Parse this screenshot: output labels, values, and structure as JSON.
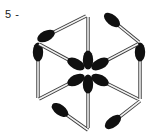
{
  "figure": {
    "kind": "matchstick-hexagon-diagram",
    "title": "",
    "axis": {
      "tick_label": "5 -",
      "tick_value": "5",
      "position": "left"
    },
    "colors": {
      "head": "#101010",
      "stick_fill": "#f2f2f2",
      "stick_outline": "#3a3a3a",
      "background": "#ffffff",
      "text": "#1a1a1a"
    },
    "counts": {
      "outer_matches": 6,
      "inner_matches": 6,
      "total_matches": 12
    },
    "geometry": {
      "center": [
        88,
        72
      ],
      "hexagon_vertices": [
        [
          88,
          15
        ],
        [
          140,
          43
        ],
        [
          140,
          100
        ],
        [
          88,
          130
        ],
        [
          37,
          100
        ],
        [
          37,
          43
        ]
      ]
    },
    "matches": [
      {
        "name": "outer-top-left",
        "head": [
          46,
          36
        ],
        "tail": [
          86,
          16
        ],
        "head_angle": -26
      },
      {
        "name": "outer-top-right",
        "head": [
          112,
          20
        ],
        "tail": [
          139,
          42
        ],
        "head_angle": 38
      },
      {
        "name": "outer-right",
        "head": [
          140,
          52
        ],
        "tail": [
          140,
          99
        ],
        "head_angle": 90
      },
      {
        "name": "outer-bottom-right",
        "head": [
          113,
          122
        ],
        "tail": [
          140,
          101
        ],
        "head_angle": -38
      },
      {
        "name": "outer-bottom-left",
        "head": [
          60,
          110
        ],
        "tail": [
          88,
          130
        ],
        "head_angle": 36
      },
      {
        "name": "outer-left",
        "head": [
          38,
          52
        ],
        "tail": [
          38,
          98
        ],
        "head_angle": 90
      },
      {
        "name": "inner-spoke-up",
        "head": [
          88,
          60
        ],
        "tail": [
          88,
          17
        ],
        "head_angle": 90
      },
      {
        "name": "inner-spoke-down",
        "head": [
          88,
          84
        ],
        "tail": [
          88,
          128
        ],
        "head_angle": 90
      },
      {
        "name": "inner-spoke-upleft",
        "head": [
          76,
          64
        ],
        "tail": [
          39,
          44
        ],
        "head_angle": 28
      },
      {
        "name": "inner-spoke-upright",
        "head": [
          100,
          64
        ],
        "tail": [
          138,
          44
        ],
        "head_angle": -28
      },
      {
        "name": "inner-spoke-downleft",
        "head": [
          76,
          80
        ],
        "tail": [
          39,
          99
        ],
        "head_angle": -28
      },
      {
        "name": "inner-spoke-downright",
        "head": [
          100,
          80
        ],
        "tail": [
          138,
          99
        ],
        "head_angle": 28
      }
    ]
  }
}
